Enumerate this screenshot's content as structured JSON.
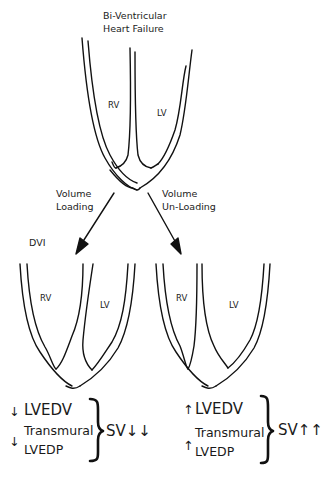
{
  "title": {
    "line1": "Bi-Ventricular",
    "line2": "Heart Failure"
  },
  "top_heart": {
    "rv_label": "RV",
    "lv_label": "LV"
  },
  "arrows": {
    "left": {
      "line1": "Volume",
      "line2": "Loading"
    },
    "right": {
      "line1": "Volume",
      "line2": "Un-Loading"
    }
  },
  "left_panel": {
    "tag": "DVI",
    "rv_label": "RV",
    "lv_label": "LV",
    "effects": {
      "lvedv_arrow": "↓",
      "lvedv_label": "LVEDV",
      "transmural_arrow": "↓",
      "transmural_line1": "Transmural",
      "transmural_line2": "LVEDP",
      "result": "SV↓↓"
    }
  },
  "right_panel": {
    "rv_label": "RV",
    "lv_label": "LV",
    "effects": {
      "lvedv_arrow": "↑",
      "lvedv_label": "LVEDV",
      "transmural_arrow": "↑",
      "transmural_line1": "Transmural",
      "transmural_line2": "LVEDP",
      "result": "SV↑↑"
    }
  }
}
